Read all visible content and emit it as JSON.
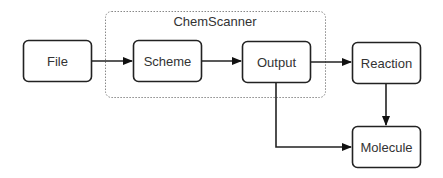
{
  "diagram": {
    "container": {
      "label": "ChemScanner"
    },
    "nodes": [
      {
        "id": "file",
        "label": "File"
      },
      {
        "id": "scheme",
        "label": "Scheme"
      },
      {
        "id": "output",
        "label": "Output"
      },
      {
        "id": "reaction",
        "label": "Reaction"
      },
      {
        "id": "molecule",
        "label": "Molecule"
      }
    ],
    "edges": [
      {
        "from": "file",
        "to": "scheme"
      },
      {
        "from": "scheme",
        "to": "output"
      },
      {
        "from": "output",
        "to": "reaction"
      },
      {
        "from": "reaction",
        "to": "molecule"
      },
      {
        "from": "output",
        "to": "molecule"
      }
    ],
    "colors": {
      "stroke": "#222222",
      "text": "#333333",
      "container": "#888888"
    }
  }
}
